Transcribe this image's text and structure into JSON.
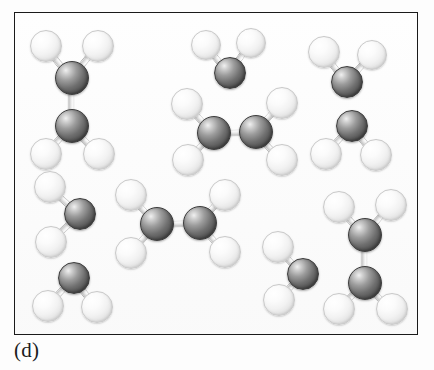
{
  "figure": {
    "caption": "(d)",
    "panel": {
      "x": 14,
      "y": 12,
      "width": 404,
      "height": 323
    },
    "background_color": "#fefefe",
    "frame_color": "#1a1a1a"
  },
  "legend": {
    "atom_types": [
      {
        "symbol": "C",
        "name": "carbon-atom",
        "shade": "dark-gray",
        "color": "#5a5a5a",
        "radius": 15
      },
      {
        "symbol": "H",
        "name": "hydrogen-atom",
        "shade": "light-white",
        "color": "#f2f2f2",
        "radius": 14
      }
    ],
    "bond_color": "#e0e0e0"
  },
  "chart_data": {
    "type": "scatter",
    "title": "(d)",
    "xlabel": "",
    "ylabel": "",
    "molecules": [
      {
        "id": "ethane-top-left",
        "formula": "C2H6",
        "orientation": "vertical",
        "atoms": [
          {
            "el": "H",
            "x": 44,
            "y": 44,
            "r": 15
          },
          {
            "el": "H",
            "x": 96,
            "y": 44,
            "r": 15
          },
          {
            "el": "C",
            "x": 70,
            "y": 76,
            "r": 16
          },
          {
            "el": "C",
            "x": 70,
            "y": 124,
            "r": 16
          },
          {
            "el": "H",
            "x": 44,
            "y": 152,
            "r": 15
          },
          {
            "el": "H",
            "x": 97,
            "y": 152,
            "r": 15
          }
        ],
        "bonds": [
          [
            0,
            2
          ],
          [
            1,
            2
          ],
          [
            2,
            3
          ],
          [
            3,
            4
          ],
          [
            3,
            5
          ]
        ]
      },
      {
        "id": "fragment-top-center",
        "formula": "CH2",
        "orientation": "apex-down",
        "atoms": [
          {
            "el": "H",
            "x": 204,
            "y": 43,
            "r": 14
          },
          {
            "el": "H",
            "x": 249,
            "y": 41,
            "r": 14
          },
          {
            "el": "C",
            "x": 228,
            "y": 71,
            "r": 15
          }
        ],
        "bonds": [
          [
            0,
            2
          ],
          [
            1,
            2
          ]
        ]
      },
      {
        "id": "fragment-top-right",
        "formula": "CH2",
        "orientation": "apex-down",
        "atoms": [
          {
            "el": "H",
            "x": 322,
            "y": 50,
            "r": 15
          },
          {
            "el": "H",
            "x": 370,
            "y": 53,
            "r": 14
          },
          {
            "el": "C",
            "x": 345,
            "y": 80,
            "r": 15
          }
        ],
        "bonds": [
          [
            0,
            2
          ],
          [
            1,
            2
          ]
        ]
      },
      {
        "id": "ethane-center",
        "formula": "C2H6",
        "orientation": "horizontal",
        "atoms": [
          {
            "el": "H",
            "x": 185,
            "y": 102,
            "r": 15
          },
          {
            "el": "H",
            "x": 186,
            "y": 158,
            "r": 15
          },
          {
            "el": "C",
            "x": 212,
            "y": 131,
            "r": 16
          },
          {
            "el": "C",
            "x": 254,
            "y": 130,
            "r": 16
          },
          {
            "el": "H",
            "x": 280,
            "y": 101,
            "r": 15
          },
          {
            "el": "H",
            "x": 280,
            "y": 158,
            "r": 15
          }
        ],
        "bonds": [
          [
            0,
            2
          ],
          [
            1,
            2
          ],
          [
            2,
            3
          ],
          [
            3,
            4
          ],
          [
            3,
            5
          ]
        ]
      },
      {
        "id": "fragment-mid-right",
        "formula": "CH2",
        "orientation": "apex-up",
        "atoms": [
          {
            "el": "C",
            "x": 350,
            "y": 124,
            "r": 15
          },
          {
            "el": "H",
            "x": 324,
            "y": 152,
            "r": 15
          },
          {
            "el": "H",
            "x": 374,
            "y": 153,
            "r": 15
          }
        ],
        "bonds": [
          [
            0,
            1
          ],
          [
            0,
            2
          ]
        ]
      },
      {
        "id": "fragment-mid-left",
        "formula": "CH2",
        "orientation": "apex-right",
        "atoms": [
          {
            "el": "H",
            "x": 48,
            "y": 185,
            "r": 15
          },
          {
            "el": "C",
            "x": 78,
            "y": 212,
            "r": 15
          },
          {
            "el": "H",
            "x": 49,
            "y": 240,
            "r": 15
          }
        ],
        "bonds": [
          [
            0,
            1
          ],
          [
            1,
            2
          ]
        ]
      },
      {
        "id": "ethane-lower-center",
        "formula": "C2H6",
        "orientation": "horizontal",
        "atoms": [
          {
            "el": "H",
            "x": 129,
            "y": 193,
            "r": 15
          },
          {
            "el": "H",
            "x": 129,
            "y": 251,
            "r": 15
          },
          {
            "el": "C",
            "x": 155,
            "y": 222,
            "r": 16
          },
          {
            "el": "C",
            "x": 198,
            "y": 221,
            "r": 16
          },
          {
            "el": "H",
            "x": 223,
            "y": 193,
            "r": 15
          },
          {
            "el": "H",
            "x": 223,
            "y": 250,
            "r": 15
          }
        ],
        "bonds": [
          [
            0,
            2
          ],
          [
            1,
            2
          ],
          [
            2,
            3
          ],
          [
            3,
            4
          ],
          [
            3,
            5
          ]
        ]
      },
      {
        "id": "ethane-bottom-right",
        "formula": "C2H6",
        "orientation": "vertical",
        "atoms": [
          {
            "el": "H",
            "x": 337,
            "y": 205,
            "r": 15
          },
          {
            "el": "H",
            "x": 389,
            "y": 203,
            "r": 15
          },
          {
            "el": "C",
            "x": 363,
            "y": 233,
            "r": 16
          },
          {
            "el": "C",
            "x": 363,
            "y": 281,
            "r": 16
          },
          {
            "el": "H",
            "x": 337,
            "y": 307,
            "r": 15
          },
          {
            "el": "H",
            "x": 390,
            "y": 307,
            "r": 15
          }
        ],
        "bonds": [
          [
            0,
            2
          ],
          [
            1,
            2
          ],
          [
            2,
            3
          ],
          [
            3,
            4
          ],
          [
            3,
            5
          ]
        ]
      },
      {
        "id": "fragment-bottom-left",
        "formula": "CH2",
        "orientation": "apex-up",
        "atoms": [
          {
            "el": "C",
            "x": 72,
            "y": 276,
            "r": 15
          },
          {
            "el": "H",
            "x": 46,
            "y": 304,
            "r": 15
          },
          {
            "el": "H",
            "x": 95,
            "y": 305,
            "r": 15
          }
        ],
        "bonds": [
          [
            0,
            1
          ],
          [
            0,
            2
          ]
        ]
      },
      {
        "id": "fragment-bottom-center",
        "formula": "CH2",
        "orientation": "apex-right",
        "atoms": [
          {
            "el": "H",
            "x": 276,
            "y": 245,
            "r": 15
          },
          {
            "el": "C",
            "x": 301,
            "y": 272,
            "r": 15
          },
          {
            "el": "H",
            "x": 277,
            "y": 298,
            "r": 15
          }
        ],
        "bonds": [
          [
            0,
            1
          ],
          [
            1,
            2
          ]
        ]
      }
    ]
  }
}
